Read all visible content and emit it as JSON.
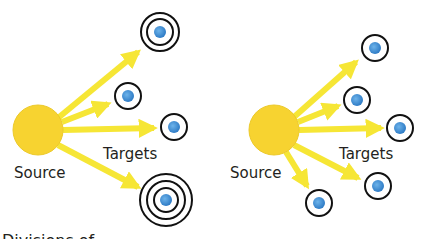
{
  "colors": {
    "source_fill": "#f7d330",
    "source_stroke": "#e8c020",
    "arrow": "#f6e635",
    "ring": "#111111",
    "target_dot": "#3f8fd6"
  },
  "panels": [
    {
      "id": "left",
      "source": {
        "label": "Source",
        "cx": 38,
        "cy": 130,
        "r": 25
      },
      "targets_label": "Targets",
      "targets": [
        {
          "cx": 160,
          "cy": 32,
          "rings": 2
        },
        {
          "cx": 128,
          "cy": 96,
          "rings": 1
        },
        {
          "cx": 174,
          "cy": 127,
          "rings": 1
        },
        {
          "cx": 166,
          "cy": 200,
          "rings": 3
        }
      ]
    },
    {
      "id": "right",
      "source": {
        "label": "Source",
        "cx": 274,
        "cy": 130,
        "r": 25
      },
      "targets_label": "Targets",
      "targets": [
        {
          "cx": 375,
          "cy": 48,
          "rings": 1
        },
        {
          "cx": 357,
          "cy": 100,
          "rings": 1
        },
        {
          "cx": 400,
          "cy": 128,
          "rings": 1
        },
        {
          "cx": 378,
          "cy": 186,
          "rings": 1
        },
        {
          "cx": 319,
          "cy": 203,
          "rings": 1
        }
      ]
    }
  ],
  "footer_text_partial": "Divisions of ..."
}
